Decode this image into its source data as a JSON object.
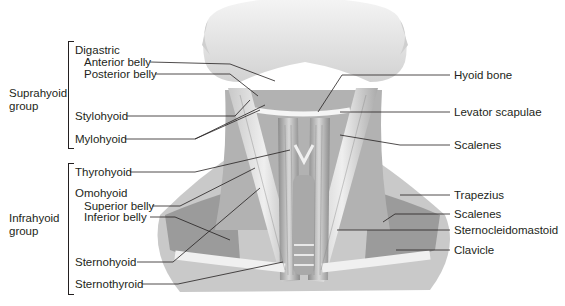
{
  "figure": {
    "groups": {
      "suprahyoid": {
        "label_line1": "Suprahyoid",
        "label_line2": "group"
      },
      "infrahyoid": {
        "label_line1": "Infrahyoid",
        "label_line2": "group"
      }
    },
    "left_labels": {
      "digastric": "Digastric",
      "anterior_belly": "Anterior belly",
      "posterior_belly": "Posterior belly",
      "stylohyoid": "Stylohyoid",
      "mylohyoid": "Mylohyoid",
      "thyrohyoid": "Thyrohyoid",
      "omohyoid": "Omohyoid",
      "superior_belly": "Superior belly",
      "inferior_belly": "Inferior belly",
      "sternohyoid": "Sternohyoid",
      "sternothyroid": "Sternothyroid"
    },
    "right_labels": {
      "hyoid_bone": "Hyoid bone",
      "levator_scapulae": "Levator scapulae",
      "scalenes_upper": "Scalenes",
      "trapezius": "Trapezius",
      "scalenes_lower": "Scalenes",
      "sternocleidomastoid": "Sternocleidomastoid",
      "clavicle": "Clavicle"
    },
    "colors": {
      "text": "#231f20",
      "leader": "#231f20",
      "skin_light": "#e6e6e6",
      "muscle_mid": "#b5b5b5",
      "muscle_dark": "#6e6e6e",
      "background": "#ffffff"
    }
  }
}
